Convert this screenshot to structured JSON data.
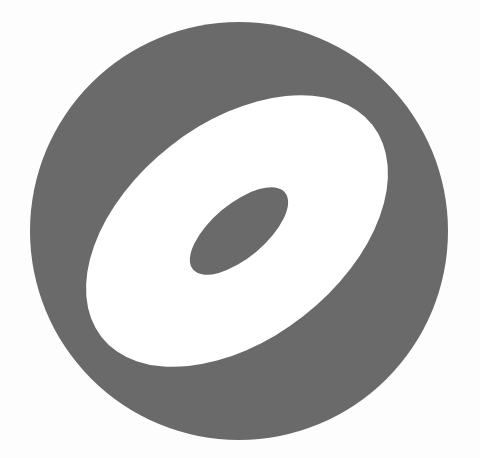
{
  "logo": {
    "name": "disc-ring-logo",
    "colors": {
      "background": "#fdfdfd",
      "outer_circle": "#6a6a6a",
      "ring": "#ffffff",
      "inner_hole": "#6a6a6a"
    }
  }
}
